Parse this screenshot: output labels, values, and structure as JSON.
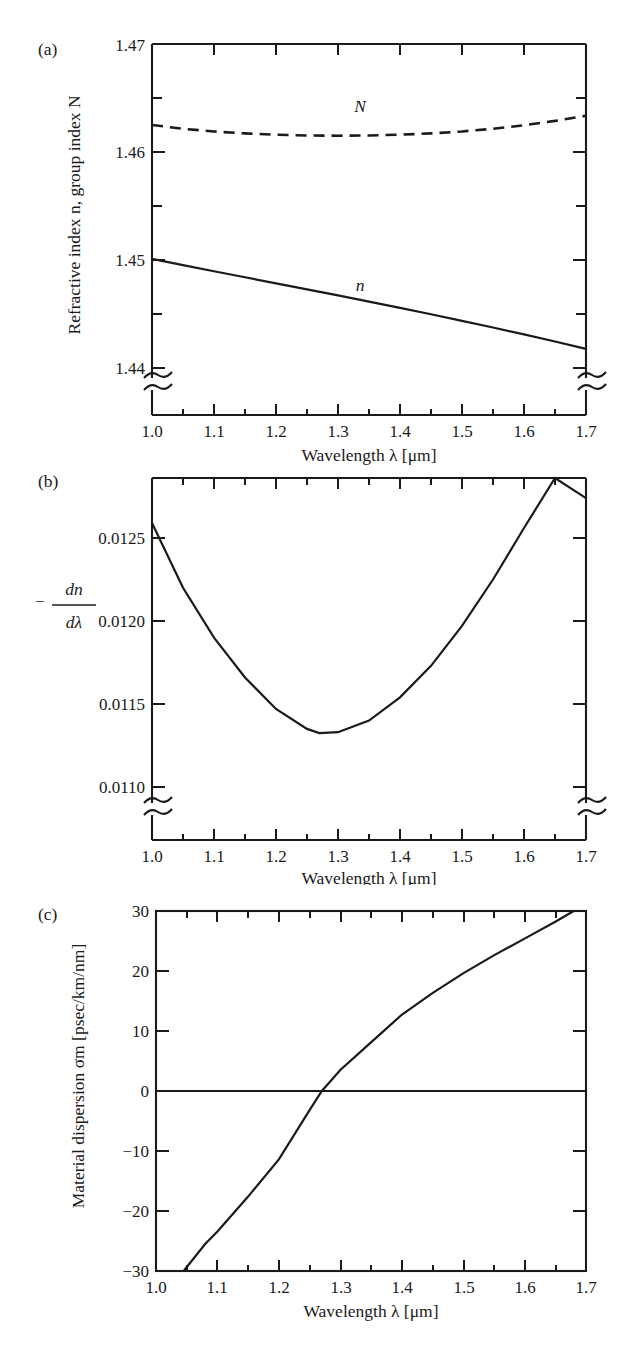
{
  "figure": {
    "shared_xaxis_title": "Wavelength λ [μm]",
    "x_ticks": [
      "1.0",
      "1.1",
      "1.2",
      "1.3",
      "1.4",
      "1.5",
      "1.6",
      "1.7"
    ]
  },
  "panels": {
    "a": {
      "letter": "(a)",
      "ylabel": "Refractive index n, group index N",
      "y_ticks": [
        "1.44",
        "1.45",
        "1.46",
        "1.47"
      ],
      "curve_labels": {
        "n": "n",
        "N": "N"
      },
      "has_axis_break": true
    },
    "b": {
      "letter": "(b)",
      "ylabel_numerator": "dn",
      "ylabel_denominator": "dλ",
      "ylabel_sign": "−",
      "y_ticks": [
        "0.0110",
        "0.0115",
        "0.0120",
        "0.0125"
      ],
      "has_axis_break": true
    },
    "c": {
      "letter": "(c)",
      "ylabel": "Material dispersion σm [psec/km/nm]",
      "y_ticks": [
        "−30",
        "−20",
        "−10",
        "0",
        "10",
        "20",
        "30"
      ],
      "has_axis_break": false,
      "has_zero_line": true
    }
  },
  "chart_data": [
    {
      "type": "line",
      "panel": "a",
      "title": "",
      "xlabel": "Wavelength λ [μm]",
      "ylabel": "Refractive index n, group index N",
      "xlim": [
        0.97,
        1.73
      ],
      "ylim": [
        1.4368,
        1.47
      ],
      "grid": false,
      "legend": "inline-annotations",
      "xticks": [
        1.0,
        1.1,
        1.2,
        1.3,
        1.4,
        1.5,
        1.6,
        1.7
      ],
      "yticks": [
        1.44,
        1.45,
        1.46,
        1.47
      ],
      "x": [
        1.0,
        1.05,
        1.1,
        1.15,
        1.2,
        1.25,
        1.3,
        1.35,
        1.4,
        1.45,
        1.5,
        1.55,
        1.6,
        1.65,
        1.7
      ],
      "series": [
        {
          "name": "n",
          "style": "solid",
          "values": [
            1.4501,
            1.44953,
            1.44896,
            1.4484,
            1.44784,
            1.44728,
            1.44672,
            1.44615,
            1.44557,
            1.44498,
            1.44437,
            1.44375,
            1.44311,
            1.44245,
            1.44177
          ]
        },
        {
          "name": "N",
          "style": "dashed",
          "values": [
            1.4625,
            1.46215,
            1.4619,
            1.46172,
            1.4616,
            1.46153,
            1.46151,
            1.46153,
            1.4616,
            1.46172,
            1.4619,
            1.46215,
            1.46248,
            1.46288,
            1.46335
          ]
        }
      ]
    },
    {
      "type": "line",
      "panel": "b",
      "title": "",
      "xlabel": "Wavelength λ [μm]",
      "ylabel": "-dn/dλ",
      "xlim": [
        0.97,
        1.73
      ],
      "ylim": [
        0.01082,
        0.0128
      ],
      "grid": false,
      "xticks": [
        1.0,
        1.1,
        1.2,
        1.3,
        1.4,
        1.5,
        1.6,
        1.7
      ],
      "yticks": [
        0.011,
        0.0115,
        0.012,
        0.0125
      ],
      "x": [
        1.0,
        1.05,
        1.1,
        1.15,
        1.2,
        1.25,
        1.27,
        1.3,
        1.35,
        1.4,
        1.45,
        1.5,
        1.55,
        1.6,
        1.65,
        1.7
      ],
      "values": [
        0.01259,
        0.0122,
        0.0119,
        0.01166,
        0.01147,
        0.01135,
        0.011325,
        0.01133,
        0.0114,
        0.01154,
        0.01173,
        0.01197,
        0.01225,
        0.01256,
        0.0129,
        0.01274
      ],
      "minimum": {
        "x": 1.27,
        "y": 0.011325
      }
    },
    {
      "type": "line",
      "panel": "c",
      "title": "",
      "xlabel": "Wavelength λ [μm]",
      "ylabel": "Material dispersion σm [psec/km/nm]",
      "xlim": [
        0.97,
        1.73
      ],
      "ylim": [
        -30,
        30
      ],
      "grid": false,
      "xticks": [
        1.0,
        1.1,
        1.2,
        1.3,
        1.4,
        1.5,
        1.6,
        1.7
      ],
      "yticks": [
        -30,
        -20,
        -10,
        0,
        10,
        20,
        30
      ],
      "zero_crossing": 1.27,
      "x": [
        1.045,
        1.08,
        1.1,
        1.15,
        1.2,
        1.25,
        1.27,
        1.3,
        1.35,
        1.4,
        1.45,
        1.5,
        1.55,
        1.6,
        1.65,
        1.68
      ],
      "values": [
        -30.0,
        -25.5,
        -23.4,
        -17.6,
        -11.4,
        -3.2,
        0.0,
        3.5,
        8.1,
        12.7,
        16.3,
        19.6,
        22.6,
        25.4,
        28.2,
        30.0
      ]
    }
  ]
}
